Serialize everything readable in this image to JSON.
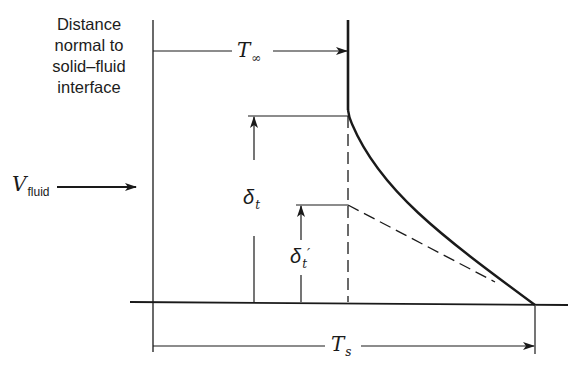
{
  "diagram": {
    "axis_title_lines": [
      "Distance",
      "normal to",
      "solid–fluid",
      "interface"
    ],
    "labels": {
      "t_inf": {
        "main": "T",
        "sub": "∞"
      },
      "t_s": {
        "main": "T",
        "sub": "s"
      },
      "v_fluid": {
        "main": "V",
        "sub": "fluid"
      },
      "delta_t": {
        "main": "δ",
        "sub": "t"
      },
      "delta_t_prime": {
        "main": "δ",
        "sub": "t",
        "prime": "′"
      }
    },
    "colors": {
      "ink": "#1a1a1a",
      "background": "#ffffff"
    }
  }
}
